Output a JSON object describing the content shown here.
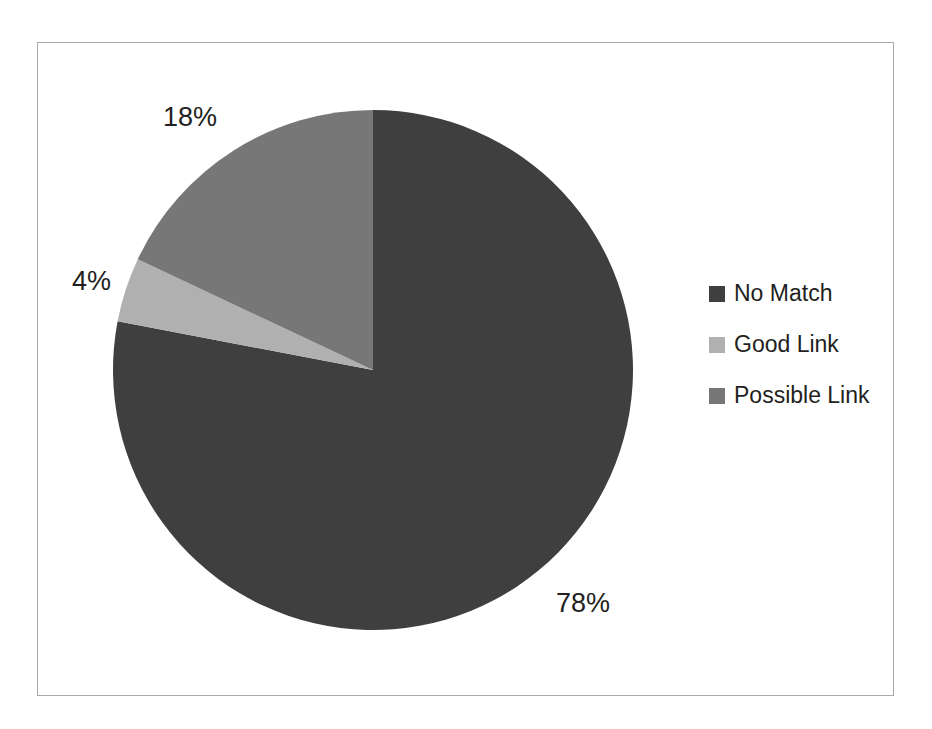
{
  "figure": {
    "frame": {
      "border_color": "#a9a9ad"
    },
    "background": "#ffffff"
  },
  "chart_data": {
    "type": "pie",
    "title": "",
    "categories": [
      "No Match",
      "Good Link",
      "Possible Link"
    ],
    "values": [
      78,
      4,
      18
    ],
    "value_labels": [
      "78%",
      "4%",
      "18%"
    ],
    "unit": "%",
    "colors": [
      "#3f3f3f",
      "#b0b0b0",
      "#777777"
    ],
    "start_angle_deg": 0,
    "direction": "clockwise",
    "legend_position": "right",
    "grid": false,
    "slices": [
      {
        "label": "No Match",
        "value": 78,
        "display": "78%",
        "color": "#3f3f3f"
      },
      {
        "label": "Good Link",
        "value": 4,
        "display": "4%",
        "color": "#b0b0b0"
      },
      {
        "label": "Possible Link",
        "value": 18,
        "display": "18%",
        "color": "#777777"
      }
    ]
  },
  "legend": {
    "items": [
      {
        "label": "No Match",
        "color": "#3f3f3f"
      },
      {
        "label": "Good Link",
        "color": "#b0b0b0"
      },
      {
        "label": "Possible Link",
        "color": "#777777"
      }
    ]
  },
  "bleed_through": {
    "visible": true,
    "note": "faint reversed text showing through scanned page"
  }
}
